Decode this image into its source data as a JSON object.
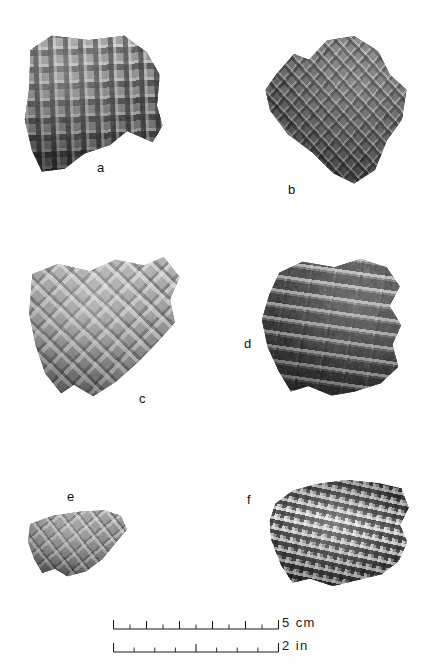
{
  "figure": {
    "kind": "archaeological-photo-plate",
    "background_color": "#ffffff",
    "ink_color": "#111111",
    "width": 435,
    "height": 666
  },
  "specimens": [
    {
      "id": "a",
      "label": "a",
      "surface_treatment": "check stamped",
      "pattern": "rectangular grid of impressed squares",
      "tone": "medium gray with dark impressions and light ridges",
      "label_position": "below-right",
      "box": {
        "x": 22,
        "y": 33,
        "width": 142,
        "height": 140
      },
      "label_xy": {
        "x": 97,
        "y": 161
      }
    },
    {
      "id": "b",
      "label": "b",
      "surface_treatment": "complicated stamped",
      "pattern": "diagonal lattice / diamond",
      "tone": "dark gray",
      "label_position": "below-left",
      "box": {
        "x": 261,
        "y": 36,
        "width": 150,
        "height": 149
      },
      "label_xy": {
        "x": 288,
        "y": 183
      }
    },
    {
      "id": "c",
      "label": "c",
      "surface_treatment": "complicated stamped",
      "pattern": "raised square blocks in diagonal rows",
      "tone": "light to medium gray",
      "label_position": "below-right",
      "box": {
        "x": 26,
        "y": 257,
        "width": 160,
        "height": 142
      },
      "label_xy": {
        "x": 139,
        "y": 392
      }
    },
    {
      "id": "d",
      "label": "d",
      "surface_treatment": "linear check stamped",
      "pattern": "brick-like elongated rectangular impressions",
      "tone": "dark gray",
      "label_position": "left",
      "box": {
        "x": 259,
        "y": 259,
        "width": 145,
        "height": 138
      },
      "label_xy": {
        "x": 244,
        "y": 337
      }
    },
    {
      "id": "e",
      "label": "e",
      "surface_treatment": "complicated stamped",
      "pattern": "faint diamond lattice",
      "tone": "medium gray",
      "label_position": "above",
      "box": {
        "x": 26,
        "y": 509,
        "width": 103,
        "height": 68
      },
      "label_xy": {
        "x": 67,
        "y": 490
      }
    },
    {
      "id": "f",
      "label": "f",
      "surface_treatment": "check stamped",
      "pattern": "fine waffle checkerboard in diagonal bands",
      "tone": "high contrast light and dark",
      "label_position": "left",
      "box": {
        "x": 267,
        "y": 480,
        "width": 143,
        "height": 107
      },
      "label_xy": {
        "x": 247,
        "y": 493
      }
    }
  ],
  "scale_bars": [
    {
      "id": "cm",
      "label": "5 cm",
      "value": 5,
      "unit": "cm",
      "major_divisions": 5,
      "minor_per_major": 2,
      "total_ticks": 10,
      "bar_x": 113,
      "bar_y": 628,
      "bar_length": 165
    },
    {
      "id": "in",
      "label": "2 in",
      "value": 2,
      "unit": "in",
      "major_divisions": 2,
      "minor_per_major": 4,
      "total_ticks": 8,
      "bar_x": 113,
      "bar_y": 651,
      "bar_length": 165
    }
  ]
}
